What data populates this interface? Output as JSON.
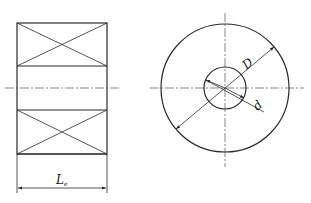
{
  "diagram": {
    "type": "technical-drawing",
    "colors": {
      "line": "#2a2a2a",
      "centerline": "#555555",
      "background": "#ffffff"
    },
    "side_view": {
      "name": "side-view",
      "rows": 3,
      "crossed_rows": [
        0,
        2
      ],
      "dimension": {
        "label": "L",
        "subscript": "e"
      }
    },
    "front_view": {
      "name": "front-view",
      "outer_circle_label": "D",
      "inner_circle_label": "d"
    }
  }
}
